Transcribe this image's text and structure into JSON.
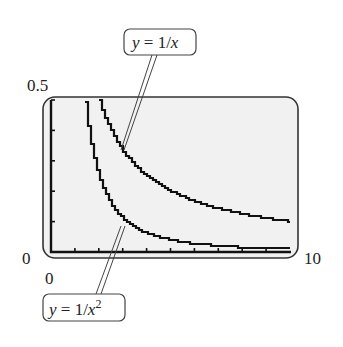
{
  "figure": {
    "window": {
      "xmin": "0",
      "xmax": "10",
      "ymin": "0",
      "ymax": "0.5"
    },
    "axis_labels": {
      "ymax_label": "0.5",
      "ymin_label": "0",
      "xmin_label": "0",
      "xmax_label": "10"
    },
    "callouts": [
      {
        "id": "reciprocal",
        "y_part": "y",
        "eq": " = 1/",
        "var": "x",
        "sup": ""
      },
      {
        "id": "inverse-square",
        "y_part": "y",
        "eq": " = 1/",
        "var": "x",
        "sup": "2"
      }
    ],
    "colors": {
      "screen_bg": "#f1f1f1",
      "curve": "#111111",
      "frame": "#333333"
    }
  },
  "chart_data": {
    "type": "line",
    "title": "",
    "xlabel": "",
    "ylabel": "",
    "xlim": [
      0,
      10
    ],
    "ylim": [
      0,
      0.5
    ],
    "grid": false,
    "legend": "callout labels with leader lines",
    "x_ticks": [
      0,
      1,
      2,
      3,
      4,
      5,
      6,
      7,
      8,
      9,
      10
    ],
    "y_ticks": [
      0,
      0.1,
      0.2,
      0.3,
      0.4,
      0.5
    ],
    "series": [
      {
        "name": "y = 1/x",
        "x": [
          2,
          2.5,
          3,
          4,
          5,
          6,
          7,
          8,
          9,
          10
        ],
        "values": [
          0.5,
          0.4,
          0.333,
          0.25,
          0.2,
          0.167,
          0.143,
          0.125,
          0.111,
          0.1
        ]
      },
      {
        "name": "y = 1/x^2",
        "x": [
          1.414,
          1.6,
          2,
          2.5,
          3,
          4,
          5,
          6,
          7,
          8,
          9,
          10
        ],
        "values": [
          0.5,
          0.391,
          0.25,
          0.16,
          0.111,
          0.0625,
          0.04,
          0.028,
          0.02,
          0.016,
          0.012,
          0.01
        ]
      }
    ]
  }
}
